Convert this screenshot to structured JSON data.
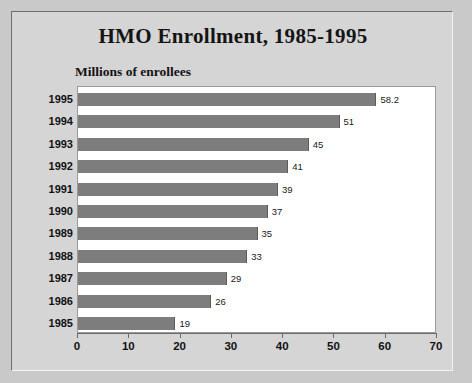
{
  "chart_data": {
    "type": "bar",
    "orientation": "horizontal",
    "title": "HMO Enrollment, 1985-1995",
    "xlabel": "",
    "ylabel": "Millions of enrollees",
    "categories": [
      "1995",
      "1994",
      "1993",
      "1992",
      "1991",
      "1990",
      "1989",
      "1988",
      "1987",
      "1986",
      "1985"
    ],
    "values": [
      58.2,
      51,
      45,
      41,
      39,
      37,
      35,
      33,
      29,
      26,
      19
    ],
    "value_labels": [
      "58.2",
      "51",
      "45",
      "41",
      "39",
      "37",
      "35",
      "33",
      "29",
      "26",
      "19"
    ],
    "xlim": [
      0,
      70
    ],
    "xticks": [
      0,
      10,
      20,
      30,
      40,
      50,
      60,
      70
    ],
    "xtick_labels": [
      "0",
      "10",
      "20",
      "30",
      "40",
      "50",
      "60",
      "70"
    ],
    "grid": false,
    "legend": null,
    "bar_color": "#7d7d7d",
    "plot_background": "#ffffff",
    "figure_background": "#d5d5d5"
  }
}
